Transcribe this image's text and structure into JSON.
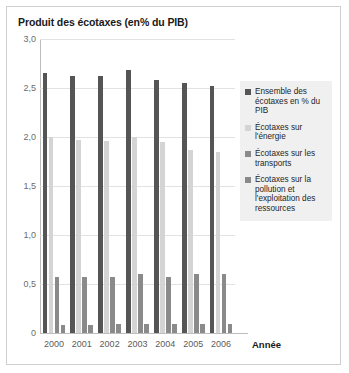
{
  "chart_data": {
    "type": "bar",
    "title": "Produit des écotaxes (en% du PIB)",
    "xlabel": "Année",
    "ylabel": "",
    "categories": [
      "2000",
      "2001",
      "2002",
      "2003",
      "2004",
      "2005",
      "2006"
    ],
    "ytick_labels": [
      "0",
      "0,5",
      "1,0",
      "1,5",
      "2,0",
      "2,5",
      "3,0"
    ],
    "ytick_values": [
      0,
      0.5,
      1.0,
      1.5,
      2.0,
      2.5,
      3.0
    ],
    "ylim": [
      0,
      3.0
    ],
    "grid": true,
    "legend_position": "right",
    "series": [
      {
        "name": "Ensemble des écotaxes en % du PIB",
        "color": "#555555",
        "values": [
          2.65,
          2.62,
          2.62,
          2.68,
          2.58,
          2.55,
          2.52
        ]
      },
      {
        "name": "Écotaxes sur l'énergie",
        "color": "#d4d4d4",
        "values": [
          2.0,
          1.97,
          1.96,
          2.0,
          1.95,
          1.87,
          1.85
        ]
      },
      {
        "name": "Écotaxes sur les transports",
        "color": "#8a8a8a",
        "values": [
          0.57,
          0.57,
          0.57,
          0.6,
          0.57,
          0.6,
          0.6
        ]
      },
      {
        "name": "Écotaxes sur la pollution et l'exploitation des ressources",
        "color": "#8a8a8a",
        "values": [
          0.08,
          0.08,
          0.09,
          0.09,
          0.09,
          0.09,
          0.09
        ]
      }
    ]
  }
}
